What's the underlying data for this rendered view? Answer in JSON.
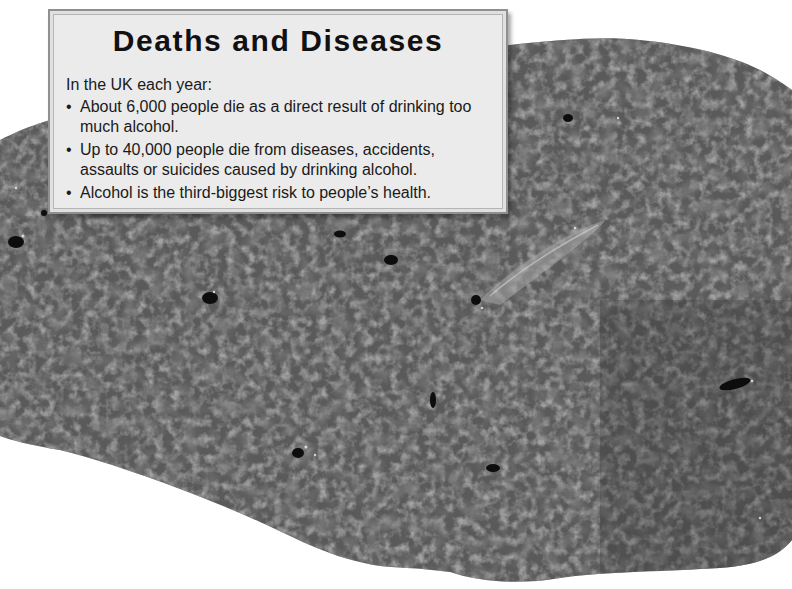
{
  "info_box": {
    "title": "Deaths and Diseases",
    "intro": "In the UK each year:",
    "bullet_glyph": "•",
    "items": [
      "About 6,000 people die as a direct result of drinking too much alcohol.",
      "Up to 40,000 people die from diseases, accidents, assaults or suicides caused by drinking alcohol.",
      "Alcohol is the third-biggest risk to people’s health."
    ]
  },
  "image": {
    "subject": "liver-cross-section-photo",
    "colors": {
      "background": "#ffffff",
      "tissue": "#5c5c5c",
      "tissue_dark": "#3a3a3a",
      "box_fill": "#ebebeb",
      "box_border": "#8f8f8f"
    }
  }
}
